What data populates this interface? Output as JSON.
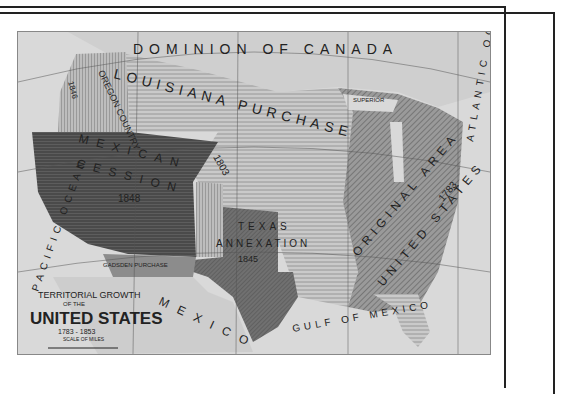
{
  "map": {
    "title": {
      "line1": "TERRITORIAL GROWTH",
      "line2": "OF THE",
      "line3": "UNITED STATES",
      "years": "1783 - 1853",
      "scale_label": "SCALE OF MILES",
      "scale_ticks": [
        "0",
        "100",
        "200",
        "300",
        "400"
      ]
    },
    "regions": {
      "louisiana": {
        "name": "LOUISIANA PURCHASE",
        "year": "1803"
      },
      "original": {
        "name": "ORIGINAL AREA",
        "sub": "OF THE",
        "name2": "UNITED STATES",
        "year": "1783"
      },
      "mexican": {
        "name": "MEXICAN",
        "name2": "CESSION",
        "year": "1848"
      },
      "texas": {
        "name": "TEXAS",
        "name2": "ANNEXATION",
        "year": "1845"
      },
      "oregon": {
        "name": "OREGON COUNTRY",
        "year": "1846"
      },
      "gadsden": {
        "name": "GADSDEN PURCHASE",
        "sub": "FROM MEXICO",
        "year": "1853"
      },
      "texas_cession": {
        "name": "TEXAS CESSION",
        "year": "1850"
      },
      "northwest": {
        "name": "NORTHWEST TERRITORY"
      },
      "florida": {
        "name": "SPANISH CESSION"
      }
    },
    "water": {
      "pacific": "PACIFIC OCEAN",
      "atlantic": "ATLANTIC OCEAN",
      "gulf": "GULF OF MEXICO",
      "superior": "SUPERIOR",
      "michigan": "MICHIGAN"
    },
    "neighbors": {
      "canada": "DOMINION OF CANADA",
      "mexico": "MEXICO"
    },
    "cities": [
      "Charleston",
      "Savannah",
      "St. Augustine",
      "New Orleans",
      "Brownsville"
    ],
    "colors": {
      "background": "#ffffff",
      "ocean": "#d9d9d9",
      "canada": "#cfcfcf",
      "louisiana": "#c4c4c4",
      "original": "#8e8e8e",
      "mexican": "#4a4a4a",
      "texas": "#6f6f6f",
      "oregon": "#b5b5b5",
      "frame": "#222222"
    }
  }
}
